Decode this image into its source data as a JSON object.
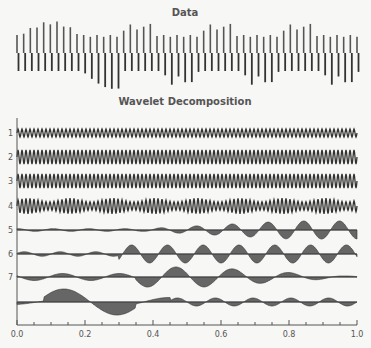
{
  "chart_data": [
    {
      "type": "line",
      "title": "Data",
      "description": "Oscillating signal (carrier ~52 cycles) modulated by slow envelope; large envelope lobe near x=0.15-0.25, then regular beats",
      "x_range": [
        0.0,
        1.0
      ]
    },
    {
      "type": "line",
      "title": "Wavelet Decomposition",
      "xlabel": "",
      "ylabel": "",
      "xlim": [
        0.0,
        1.0
      ],
      "x_ticks": [
        "0.0",
        "0.2",
        "0.4",
        "0.6",
        "0.8",
        "1.0"
      ],
      "series": [
        {
          "name": "1",
          "description": "high-frequency, small constant amplitude"
        },
        {
          "name": "2",
          "description": "high-frequency, medium amplitude"
        },
        {
          "name": "3",
          "description": "high-frequency, medium amplitude"
        },
        {
          "name": "4",
          "description": "high-frequency, slightly modulated"
        },
        {
          "name": "5",
          "description": "low-frequency oscillation growing toward x=1"
        },
        {
          "name": "6",
          "description": "low-frequency oscillation, strong from x=0.35"
        },
        {
          "name": "7",
          "description": "low-frequency oscillation peaking near x=0.45, decaying after 0.8"
        },
        {
          "name": "",
          "description": "very low-frequency approximation, large lobe near x=0.23"
        }
      ]
    }
  ],
  "titles": {
    "data": "Data",
    "decomp": "Wavelet Decomposition"
  },
  "row_labels": [
    "1",
    "2",
    "3",
    "4",
    "5",
    "6",
    "7"
  ],
  "x_ticks": [
    "0.0",
    "0.2",
    "0.4",
    "0.6",
    "0.8",
    "1.0"
  ],
  "colors": {
    "ink": "#333333",
    "light": "#888888",
    "axis": "#555555"
  }
}
